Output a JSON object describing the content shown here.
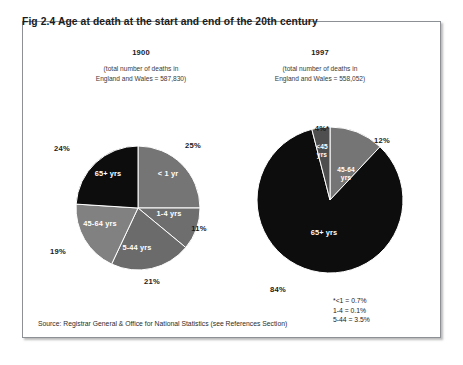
{
  "figure": {
    "label": "Fig 2.4",
    "title": "Fig 2.4   Age at death at the start and end of the 20th century"
  },
  "panels": {
    "left": {
      "year": "1900",
      "note_line1": "(total number of deaths in",
      "note_line2": "England and Wales = 587,830)"
    },
    "right": {
      "year": "1997",
      "note_line1": "(total number of deaths in",
      "note_line2": "England and Wales  = 558,052)"
    }
  },
  "footnote": {
    "line1": "*<1 = 0.7%",
    "line2": "1-4 = 0.1%",
    "line3": "5-44 = 3.5%"
  },
  "source": "Source: Registrar General & Office for National Statistics (see References Section)",
  "colors": {
    "dark": "#0d0d0d",
    "mid_grey": "#757575",
    "light_grey": "#8a8a8a",
    "mid_dark_grey": "#4f4f4f",
    "frame": "#8d9094",
    "text": "#1b1b1b",
    "label_on_slice": "#ffffff"
  },
  "chart_data": [
    {
      "type": "pie",
      "title": "1900",
      "subtitle": "(total number of deaths in England and Wales = 587,830)",
      "total_deaths": 587830,
      "units": "percent of deaths",
      "start_angle_deg": 0,
      "direction": "clockwise",
      "legend": "none (labels drawn inside slices)",
      "slices": [
        {
          "label": "< 1 yr",
          "value": 25,
          "pct_label": "25%",
          "color": "#757575",
          "label_x": 168,
          "label_y": 176,
          "pct_x": 193,
          "pct_y": 148
        },
        {
          "label": "1-4 yrs",
          "value": 11,
          "pct_label": "11%",
          "color": "#6e6e6e",
          "label_x": 169,
          "label_y": 216,
          "pct_x": 199,
          "pct_y": 231
        },
        {
          "label": "5-44 yrs",
          "value": 21,
          "pct_label": "21%",
          "color": "#6b6b6b",
          "label_x": 137,
          "label_y": 250,
          "pct_x": 152,
          "pct_y": 284
        },
        {
          "label": "45-64 yrs",
          "value": 19,
          "pct_label": "19%",
          "color": "#818181",
          "label_x": 100,
          "label_y": 226,
          "pct_x": 58,
          "pct_y": 254
        },
        {
          "label": "65+ yrs",
          "value": 24,
          "pct_label": "24%",
          "color": "#0d0d0d",
          "label_x": 108,
          "label_y": 176,
          "pct_x": 62,
          "pct_y": 151
        }
      ]
    },
    {
      "type": "pie",
      "title": "1997",
      "subtitle": "(total number of deaths in England and Wales = 558,052)",
      "total_deaths": 558052,
      "units": "percent of deaths",
      "start_angle_deg": 0,
      "direction": "clockwise",
      "legend": "none (labels drawn inside slices)",
      "slices": [
        {
          "label": "45-64\nyrs",
          "value": 12,
          "pct_label": "12%",
          "color": "#757575",
          "label_x": 346,
          "label_y": 172,
          "pct_x": 382,
          "pct_y": 143
        },
        {
          "label": "65+ yrs",
          "value": 84,
          "pct_label": "84%",
          "color": "#0d0d0d",
          "label_x": 324,
          "label_y": 235,
          "pct_x": 278,
          "pct_y": 292
        },
        {
          "label": "<45\nyrs",
          "value": 4,
          "pct_label": "4%*",
          "color": "#4f4f4f",
          "label_x": 322,
          "label_y": 149,
          "pct_x": 322,
          "pct_y": 131
        }
      ],
      "footnote_detail": {
        "<1": 0.7,
        "1-4": 0.1,
        "5-44": 3.5
      }
    }
  ]
}
